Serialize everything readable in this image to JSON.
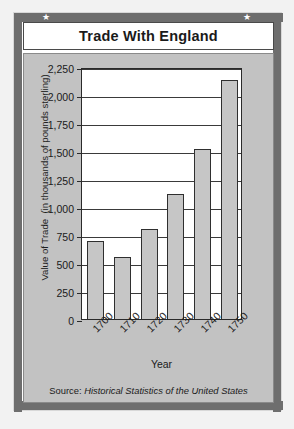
{
  "card": {
    "title": "Trade With England",
    "star_icon": "★",
    "source_prefix": "Source: ",
    "source_title": "Historical Statistics of the United States"
  },
  "colors": {
    "page_background": "#f2f2f2",
    "card_background": "#ffffff",
    "frame_band": "#6e6e6e",
    "panel_background": "#c2c2c2",
    "plot_background": "#ffffff",
    "bar_fill": "#c6c6c6",
    "bar_stroke": "#2f2f2f",
    "gridline": "#3a3a3a",
    "text": "#1a1a1a"
  },
  "chart_data": {
    "type": "bar",
    "title": "Trade With England",
    "xlabel": "Year",
    "ylabel": "Value of Trade  (in thousands of pounds sterling)",
    "categories": [
      "1700",
      "1710",
      "1720",
      "1730",
      "1740",
      "1750"
    ],
    "values": [
      700,
      555,
      800,
      1120,
      1520,
      2130
    ],
    "ylim": [
      0,
      2250
    ],
    "yticks": [
      0,
      250,
      500,
      750,
      1000,
      1250,
      1500,
      1750,
      2000,
      2250
    ],
    "ytick_labels": [
      "0",
      "250",
      "500",
      "750",
      "1,000",
      "1,250",
      "1,500",
      "1,750",
      "2,000",
      "2,250"
    ],
    "grid": true,
    "legend": false,
    "xtick_rotation": -45,
    "source": "Source: Historical Statistics of the United States"
  }
}
